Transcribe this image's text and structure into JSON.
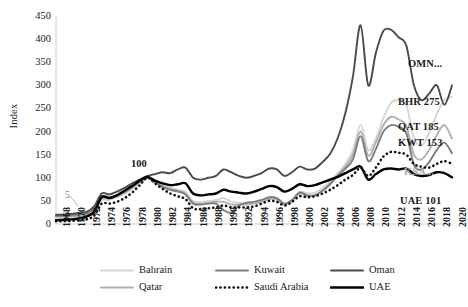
{
  "chart_data": {
    "type": "line",
    "title": "",
    "xlabel": "",
    "ylabel": "Index",
    "ylim": [
      0,
      450
    ],
    "yticks": [
      0,
      50,
      100,
      150,
      200,
      250,
      300,
      350,
      400,
      450
    ],
    "grid": false,
    "legend_position": "bottom",
    "x": [
      1968,
      1969,
      1970,
      1971,
      1972,
      1973,
      1974,
      1975,
      1976,
      1977,
      1978,
      1979,
      1980,
      1981,
      1982,
      1983,
      1984,
      1985,
      1986,
      1987,
      1988,
      1989,
      1990,
      1991,
      1992,
      1993,
      1994,
      1995,
      1996,
      1997,
      1998,
      1999,
      2000,
      2001,
      2002,
      2003,
      2004,
      2005,
      2006,
      2007,
      2008,
      2009,
      2010,
      2011,
      2012,
      2013,
      2014,
      2015,
      2016,
      2017,
      2018,
      2019,
      2020
    ],
    "xticks": [
      "1968",
      "1970",
      "1972",
      "1974",
      "1976",
      "1978",
      "1980",
      "1982",
      "1984",
      "1986",
      "1988",
      "1990",
      "1992",
      "1994",
      "1996",
      "1998",
      "2000",
      "2002",
      "2004",
      "2006",
      "2008",
      "2010",
      "2012",
      "2014",
      "2016",
      "2018",
      "2020"
    ],
    "series": [
      {
        "name": "Bahrain",
        "code": "BHR",
        "color": "#d6d6d6",
        "style": "solid",
        "end_value": 275,
        "values": [
          14,
          14,
          15,
          16,
          17,
          24,
          50,
          52,
          58,
          66,
          76,
          88,
          100,
          92,
          84,
          78,
          74,
          70,
          50,
          48,
          50,
          52,
          56,
          48,
          46,
          44,
          46,
          50,
          56,
          54,
          44,
          52,
          70,
          66,
          68,
          78,
          92,
          110,
          130,
          160,
          215,
          160,
          185,
          230,
          262,
          268,
          258,
          186,
          170,
          196,
          238,
          268,
          275
        ]
      },
      {
        "name": "Kuwait",
        "code": "KWT",
        "color": "#7d7d7d",
        "style": "solid",
        "end_value": 153,
        "values": [
          18,
          18,
          19,
          21,
          23,
          32,
          60,
          58,
          62,
          70,
          80,
          92,
          100,
          90,
          80,
          74,
          70,
          64,
          44,
          42,
          44,
          44,
          30,
          24,
          40,
          46,
          48,
          52,
          58,
          56,
          44,
          52,
          68,
          62,
          62,
          72,
          86,
          104,
          120,
          140,
          190,
          136,
          162,
          200,
          214,
          210,
          196,
          128,
          118,
          134,
          160,
          176,
          153
        ]
      },
      {
        "name": "Oman",
        "code": "OMN",
        "color": "#4a4a4a",
        "style": "solid",
        "end_value": 300,
        "values": [
          20,
          20,
          22,
          24,
          26,
          38,
          66,
          64,
          70,
          78,
          88,
          96,
          104,
          108,
          112,
          110,
          118,
          122,
          100,
          96,
          100,
          104,
          118,
          112,
          104,
          100,
          104,
          110,
          120,
          118,
          104,
          112,
          124,
          118,
          120,
          134,
          152,
          186,
          240,
          320,
          430,
          300,
          370,
          418,
          420,
          404,
          386,
          300,
          268,
          282,
          300,
          258,
          300
        ]
      },
      {
        "name": "Qatar",
        "code": "QAT",
        "color": "#b0b0b0",
        "style": "solid",
        "end_value": 185,
        "values": [
          16,
          16,
          17,
          18,
          20,
          28,
          54,
          54,
          60,
          68,
          78,
          90,
          100,
          90,
          82,
          76,
          72,
          66,
          46,
          44,
          46,
          48,
          48,
          42,
          42,
          42,
          44,
          48,
          54,
          52,
          42,
          50,
          66,
          60,
          62,
          72,
          88,
          106,
          124,
          150,
          200,
          148,
          176,
          214,
          232,
          226,
          212,
          150,
          140,
          160,
          192,
          214,
          185
        ]
      },
      {
        "name": "Saudi Arabia",
        "code": "KSA",
        "color": "#111111",
        "style": "dotted",
        "end_value": 130,
        "values": [
          6,
          6,
          7,
          8,
          10,
          18,
          44,
          44,
          48,
          56,
          68,
          84,
          100,
          88,
          76,
          66,
          60,
          54,
          34,
          32,
          34,
          36,
          40,
          36,
          36,
          36,
          38,
          44,
          50,
          48,
          40,
          48,
          60,
          58,
          60,
          66,
          74,
          84,
          96,
          106,
          122,
          104,
          122,
          146,
          156,
          154,
          150,
          130,
          124,
          122,
          130,
          136,
          130
        ]
      },
      {
        "name": "UAE",
        "code": "UAE",
        "color": "#000000",
        "style": "solid-thick",
        "end_value": 101,
        "values": [
          8,
          9,
          10,
          12,
          16,
          26,
          58,
          56,
          62,
          72,
          82,
          94,
          102,
          94,
          88,
          84,
          86,
          88,
          66,
          62,
          64,
          66,
          74,
          70,
          68,
          66,
          70,
          76,
          82,
          80,
          70,
          76,
          86,
          82,
          84,
          90,
          96,
          102,
          110,
          118,
          124,
          96,
          108,
          118,
          120,
          118,
          120,
          108,
          104,
          106,
          112,
          110,
          101
        ]
      }
    ],
    "annotations": [
      {
        "text": "100",
        "x": 1980,
        "y": 100,
        "name": "base-year-annotation"
      },
      {
        "text": "5",
        "x": 1970,
        "y": 50,
        "name": "value-5-annotation"
      }
    ],
    "end_labels": [
      {
        "text": "OMN...",
        "name": "series-end-label-oman",
        "muted": false
      },
      {
        "text": "BHR 275",
        "name": "series-end-label-bahrain",
        "muted": false
      },
      {
        "text": "QAT 185",
        "name": "series-end-label-qatar",
        "muted": false
      },
      {
        "text": "KWT 153",
        "name": "series-end-label-kuwait",
        "muted": false
      },
      {
        "text": "KSA...",
        "name": "series-end-label-saudi-arabia",
        "muted": true
      },
      {
        "text": "UAE 101",
        "name": "series-end-label-uae",
        "muted": false
      }
    ]
  },
  "legend": {
    "items": [
      {
        "label": "Bahrain",
        "style": "solid",
        "color": "#d6d6d6"
      },
      {
        "label": "Kuwait",
        "style": "solid",
        "color": "#7d7d7d"
      },
      {
        "label": "Oman",
        "style": "solid",
        "color": "#4a4a4a"
      },
      {
        "label": "Qatar",
        "style": "solid",
        "color": "#b0b0b0"
      },
      {
        "label": "Saudi Arabia",
        "style": "dotted",
        "color": "#111111"
      },
      {
        "label": "UAE",
        "style": "solid-thick",
        "color": "#000000"
      }
    ]
  }
}
